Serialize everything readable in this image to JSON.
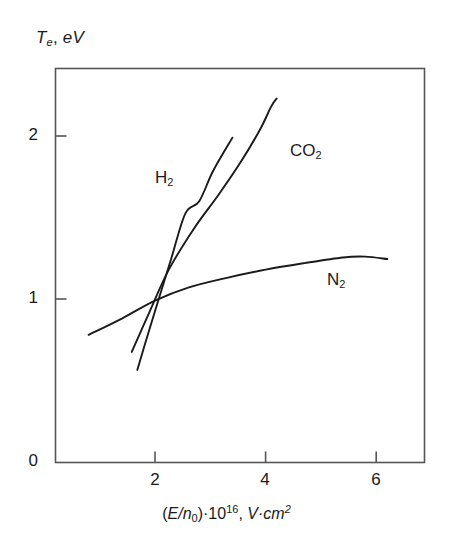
{
  "figure": {
    "background_color": "#ffffff",
    "line_color": "#1a1a1a",
    "axis_color": "#555555"
  },
  "axis_labels": {
    "y": {
      "symbol": "T",
      "subscript": "e",
      "comma": ",",
      "unit": "eV",
      "full_text": "Te, eV"
    },
    "x": {
      "open_paren": "(",
      "numerator": "E",
      "slash": "/",
      "denominator": "n",
      "denominator_sub": "0",
      "close_paren": ")",
      "multiply": "·",
      "base": "10",
      "exponent": "16",
      "comma": ",",
      "unit_v": "V",
      "unit_dot": "·",
      "unit_cm": "cm",
      "unit_exp": "2",
      "full_text": "(E/n0)·1016, V·cm2"
    }
  },
  "ticks": {
    "y": [
      {
        "label": "0",
        "value": 0
      },
      {
        "label": "1",
        "value": 1
      },
      {
        "label": "2",
        "value": 2
      }
    ],
    "x": [
      {
        "label": "2",
        "value": 2
      },
      {
        "label": "4",
        "value": 4
      },
      {
        "label": "6",
        "value": 6
      }
    ]
  },
  "curve_labels": [
    {
      "name": "H2",
      "main": "H",
      "sub": "2"
    },
    {
      "name": "CO2",
      "main": "CO",
      "sub": "2"
    },
    {
      "name": "N2",
      "main": "N",
      "sub": "2"
    }
  ],
  "chart_data": {
    "type": "line",
    "title": "",
    "xlabel": "(E/n0)·10^16, V·cm^2",
    "ylabel": "Te, eV",
    "xlim": [
      0.2,
      6.85
    ],
    "ylim": [
      0,
      2.42
    ],
    "xticks": [
      2,
      4,
      6
    ],
    "yticks": [
      0,
      1,
      2
    ],
    "grid": false,
    "legend": "inline-annotations",
    "series": [
      {
        "name": "H2",
        "label": "H2",
        "label_position": {
          "x": 1.95,
          "y": 1.72
        },
        "points": [
          {
            "x": 1.68,
            "y": 0.565
          },
          {
            "x": 1.9,
            "y": 0.815
          },
          {
            "x": 2.1,
            "y": 1.035
          },
          {
            "x": 2.3,
            "y": 1.255
          },
          {
            "x": 2.55,
            "y": 1.525
          },
          {
            "x": 2.8,
            "y": 1.6
          },
          {
            "x": 3.05,
            "y": 1.785
          },
          {
            "x": 3.4,
            "y": 1.99
          }
        ]
      },
      {
        "name": "CO2",
        "label": "CO2",
        "label_position": {
          "x": 4.2,
          "y": 1.82
        },
        "points": [
          {
            "x": 1.58,
            "y": 0.675
          },
          {
            "x": 1.9,
            "y": 0.92
          },
          {
            "x": 2.25,
            "y": 1.18
          },
          {
            "x": 2.7,
            "y": 1.43
          },
          {
            "x": 3.15,
            "y": 1.64
          },
          {
            "x": 3.55,
            "y": 1.84
          },
          {
            "x": 3.9,
            "y": 2.04
          },
          {
            "x": 4.1,
            "y": 2.18
          },
          {
            "x": 4.2,
            "y": 2.23
          }
        ]
      },
      {
        "name": "N2",
        "label": "N2",
        "label_position": {
          "x": 5.18,
          "y": 1.08
        },
        "points": [
          {
            "x": 0.8,
            "y": 0.78
          },
          {
            "x": 1.4,
            "y": 0.88
          },
          {
            "x": 2.0,
            "y": 0.99
          },
          {
            "x": 2.6,
            "y": 1.07
          },
          {
            "x": 3.3,
            "y": 1.13
          },
          {
            "x": 4.0,
            "y": 1.18
          },
          {
            "x": 4.7,
            "y": 1.22
          },
          {
            "x": 5.4,
            "y": 1.255
          },
          {
            "x": 5.8,
            "y": 1.26
          },
          {
            "x": 6.2,
            "y": 1.245
          }
        ]
      }
    ]
  }
}
